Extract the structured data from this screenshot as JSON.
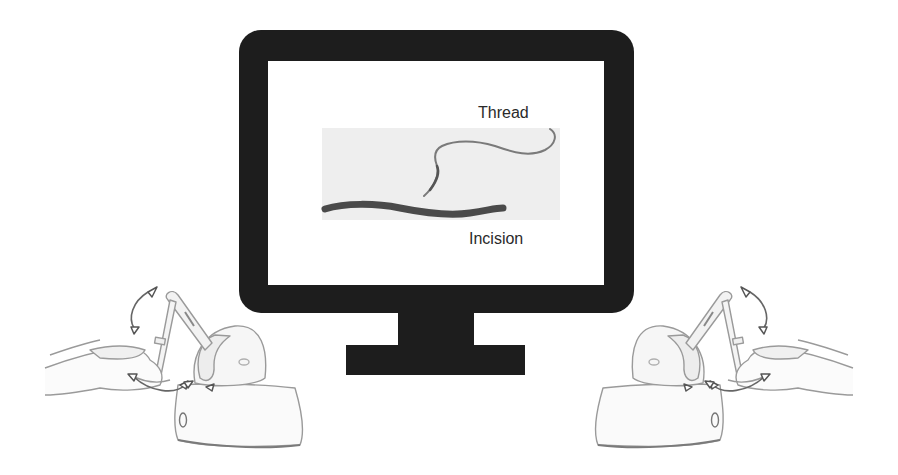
{
  "figure": {
    "monitor": {
      "screen": {
        "labels": {
          "thread": "Thread",
          "incision": "Incision"
        }
      }
    },
    "devices": [
      {
        "side": "left",
        "type": "haptic-stylus-device"
      },
      {
        "side": "right",
        "type": "haptic-stylus-device"
      }
    ],
    "colors": {
      "monitor": "#1d1d1d",
      "screen": "#ffffff",
      "sim_panel": "#eeeeee",
      "incision": "#4a4a4a",
      "thread": "#7a7a7a",
      "device_line": "#9a9a9a",
      "arrow": "#555555"
    }
  }
}
